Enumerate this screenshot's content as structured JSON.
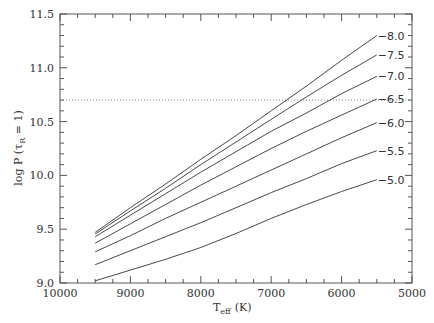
{
  "chart_data": {
    "type": "line",
    "title": "",
    "xlabel": "T_eff (K)",
    "xlabel_main": "T",
    "xlabel_sub": "eff",
    "xlabel_unit": "(K)",
    "ylabel": "log P (τ_R = 1)",
    "ylabel_main": "log P (τ",
    "ylabel_sub": "R",
    "ylabel_tail": " = 1)",
    "xlim": [
      10000,
      5000
    ],
    "ylim": [
      9.0,
      11.5
    ],
    "x_reversed": true,
    "grid": false,
    "legend": "inline labels at right end of curves",
    "x_ticks": [
      10000,
      9000,
      8000,
      7000,
      6000,
      5000
    ],
    "x_tick_labels": [
      "10000",
      "9000",
      "8000",
      "7000",
      "6000",
      "5000"
    ],
    "y_ticks": [
      9.0,
      9.5,
      10.0,
      10.5,
      11.0,
      11.5
    ],
    "y_tick_labels": [
      "9.0",
      "9.5",
      "10.0",
      "10.5",
      "11.0",
      "11.5"
    ],
    "reference_line": {
      "y": 10.7,
      "style": "dotted"
    },
    "x": [
      9500,
      9000,
      8500,
      8000,
      7500,
      7000,
      6500,
      6000,
      5500
    ],
    "series": [
      {
        "name": "-8.0",
        "values": [
          9.47,
          9.7,
          9.92,
          10.15,
          10.37,
          10.6,
          10.83,
          11.07,
          11.3
        ]
      },
      {
        "name": "-7.5",
        "values": [
          9.455,
          9.67,
          9.88,
          10.1,
          10.31,
          10.52,
          10.73,
          10.93,
          11.12
        ]
      },
      {
        "name": "-7.0",
        "values": [
          9.43,
          9.63,
          9.83,
          10.03,
          10.22,
          10.41,
          10.58,
          10.76,
          10.92
        ]
      },
      {
        "name": "-6.5",
        "values": [
          9.37,
          9.55,
          9.73,
          9.91,
          10.08,
          10.25,
          10.41,
          10.56,
          10.71
        ]
      },
      {
        "name": "-6.0",
        "values": [
          9.29,
          9.44,
          9.6,
          9.75,
          9.9,
          10.05,
          10.2,
          10.35,
          10.49
        ]
      },
      {
        "name": "-5.5",
        "values": [
          9.17,
          9.3,
          9.43,
          9.56,
          9.7,
          9.84,
          9.97,
          10.11,
          10.23
        ]
      },
      {
        "name": "-5.0",
        "values": [
          9.02,
          9.12,
          9.22,
          9.33,
          9.46,
          9.6,
          9.73,
          9.85,
          9.96
        ]
      }
    ]
  }
}
